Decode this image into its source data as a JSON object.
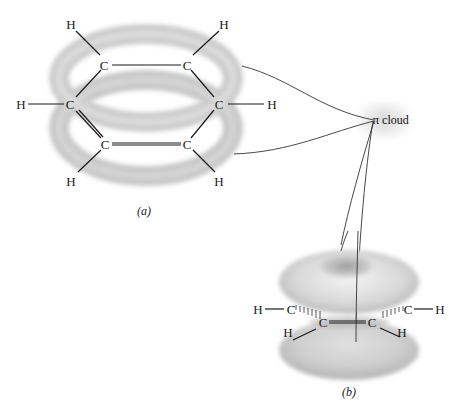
{
  "figure": {
    "panel_a": {
      "caption": "(a)",
      "molecule": "benzene",
      "carbon_label": "C",
      "hydrogen_label": "H",
      "carbons": [
        {
          "id": "c1",
          "label": "C"
        },
        {
          "id": "c2",
          "label": "C"
        },
        {
          "id": "c3",
          "label": "C"
        },
        {
          "id": "c4",
          "label": "C"
        },
        {
          "id": "c5",
          "label": "C"
        },
        {
          "id": "c6",
          "label": "C"
        }
      ],
      "hydrogens": [
        {
          "id": "h1",
          "label": "H"
        },
        {
          "id": "h2",
          "label": "H"
        },
        {
          "id": "h3",
          "label": "H"
        },
        {
          "id": "h4",
          "label": "H"
        },
        {
          "id": "h5",
          "label": "H"
        },
        {
          "id": "h6",
          "label": "H"
        }
      ]
    },
    "callout": {
      "label": "π cloud"
    },
    "panel_b": {
      "caption": "(b)",
      "carbons": [
        {
          "id": "c1",
          "label": "C"
        },
        {
          "id": "c2",
          "label": "C"
        },
        {
          "id": "c3",
          "label": "C"
        },
        {
          "id": "c4",
          "label": "C"
        }
      ],
      "hydrogens": [
        {
          "id": "h1",
          "label": "H"
        },
        {
          "id": "h2",
          "label": "H"
        },
        {
          "id": "h3",
          "label": "H"
        },
        {
          "id": "h4",
          "label": "H"
        }
      ]
    },
    "colors": {
      "cloud_gray": "#bdbdbd",
      "cloud_light": "#e4e4e4",
      "ink": "#1a1a1a"
    }
  }
}
